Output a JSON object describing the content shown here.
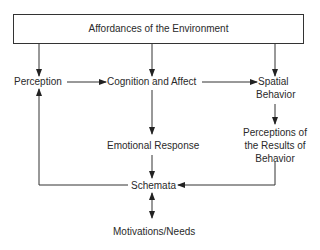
{
  "diagram": {
    "title_box": "Affordances of the Environment",
    "nodes": {
      "perception": "Perception",
      "cognition": "Cognition and Affect",
      "spatial_line1": "Spatial",
      "spatial_line2": "Behavior",
      "emotional": "Emotional Response",
      "results_line1": "Perceptions of",
      "results_line2": "the Results of",
      "results_line3": "Behavior",
      "schemata": "Schemata",
      "motivations": "Motivations/Needs"
    },
    "edges": [
      {
        "from": "Affordances of the Environment",
        "to": "Perception"
      },
      {
        "from": "Affordances of the Environment",
        "to": "Cognition and Affect"
      },
      {
        "from": "Affordances of the Environment",
        "to": "Spatial Behavior"
      },
      {
        "from": "Perception",
        "to": "Cognition and Affect"
      },
      {
        "from": "Cognition and Affect",
        "to": "Spatial Behavior"
      },
      {
        "from": "Cognition and Affect",
        "to": "Emotional Response"
      },
      {
        "from": "Spatial Behavior",
        "to": "Perceptions of the Results of Behavior"
      },
      {
        "from": "Emotional Response",
        "to": "Schemata"
      },
      {
        "from": "Perceptions of the Results of Behavior",
        "to": "Schemata"
      },
      {
        "from": "Schemata",
        "to": "Perception"
      },
      {
        "from": "Schemata",
        "to": "Motivations/Needs",
        "bidirectional": true
      }
    ]
  }
}
